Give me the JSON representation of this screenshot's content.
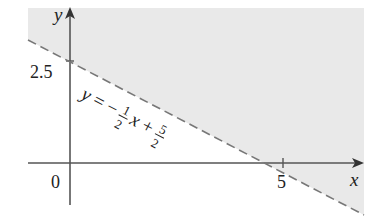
{
  "figure": {
    "type": "inequality-region-graph",
    "axes": {
      "x_label": "x",
      "y_label": "y",
      "origin_label": "0",
      "x_tick_label": "5",
      "y_tick_label": "2.5"
    },
    "boundary_line": {
      "style": "dashed",
      "equation_parts": {
        "lhs": "y",
        "eq": "=",
        "minus": "−",
        "frac1_num": "1",
        "frac1_den": "2",
        "var": "x",
        "plus": "+",
        "frac2_num": "5",
        "frac2_den": "2"
      },
      "equation_text": "y = −(1/2)x + 5/2",
      "x_intercept": 5,
      "y_intercept": 2.5
    },
    "shaded_region": "above line",
    "colors": {
      "shade": "#e9e9e9",
      "axis": "#555555",
      "dash": "#777777",
      "text": "#222222"
    }
  }
}
